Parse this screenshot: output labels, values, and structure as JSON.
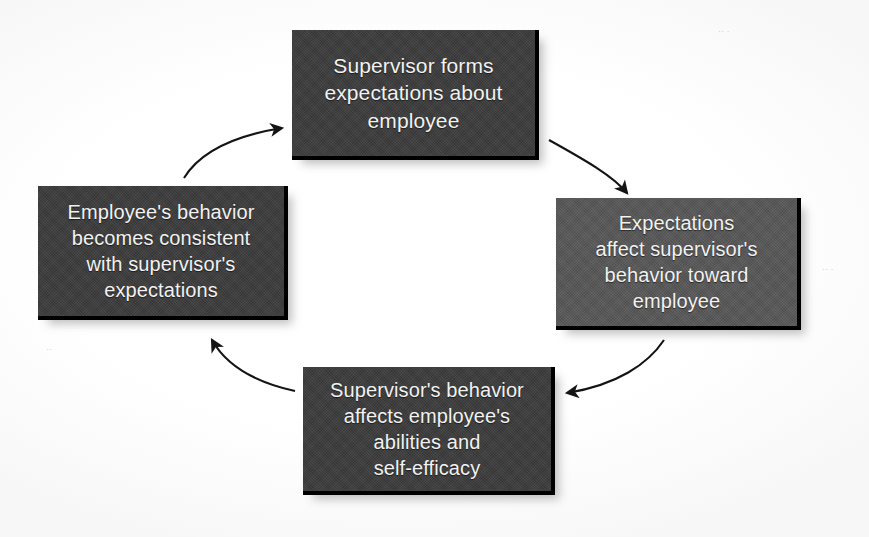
{
  "diagram": {
    "type": "cycle-diagram",
    "flow_direction": "clockwise",
    "background_color": "#ffffff",
    "node_fill_dark": "#3b3b3b",
    "node_fill_mid": "#565656",
    "node_text_color": "#f2f2f2",
    "arrow_color": "#1a1a1a",
    "nodes": [
      {
        "id": "top",
        "position": "top",
        "lines": [
          "Supervisor forms",
          "expectations about",
          "employee"
        ],
        "text": "Supervisor forms expectations about employee"
      },
      {
        "id": "right",
        "position": "right",
        "lines": [
          "Expectations",
          "affect supervisor's",
          "behavior toward",
          "employee"
        ],
        "text": "Expectations affect supervisor's behavior toward employee"
      },
      {
        "id": "bottom",
        "position": "bottom",
        "lines": [
          "Supervisor's behavior",
          "affects employee's",
          "abilities and",
          "self-efficacy"
        ],
        "text": "Supervisor's behavior affects employee's abilities and self-efficacy"
      },
      {
        "id": "left",
        "position": "left",
        "lines": [
          "Employee's behavior",
          "becomes consistent",
          "with supervisor's",
          "expectations"
        ],
        "text": "Employee's behavior becomes consistent with supervisor's expectations"
      }
    ],
    "arrows": [
      {
        "id": "top-to-right",
        "from": "top",
        "to": "right",
        "style": "curved",
        "head": "arrow"
      },
      {
        "id": "right-to-bottom",
        "from": "right",
        "to": "bottom",
        "style": "curved",
        "head": "arrow"
      },
      {
        "id": "bottom-to-left",
        "from": "bottom",
        "to": "left",
        "style": "curved",
        "head": "arrow"
      },
      {
        "id": "left-to-top",
        "from": "left",
        "to": "top",
        "style": "curved",
        "head": "arrow"
      }
    ],
    "artifacts": [
      {
        "id": "speck-top-right",
        "mark": "·· ·"
      },
      {
        "id": "speck-mid-right",
        "mark": "·· ·"
      },
      {
        "id": "speck-left",
        "mark": "··"
      }
    ]
  }
}
